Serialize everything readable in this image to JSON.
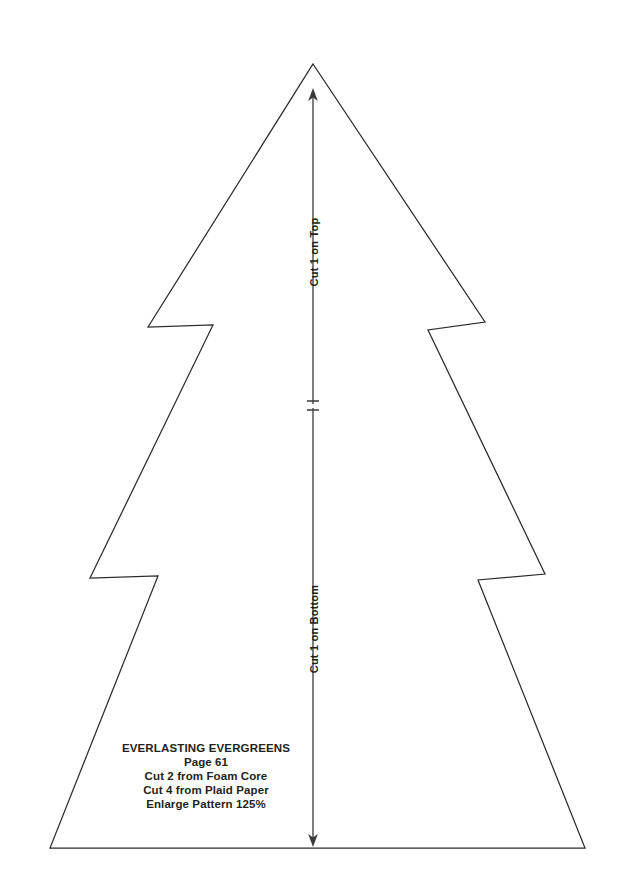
{
  "sheet": {
    "title": "Everlasting Evergreens tree pattern template",
    "background_color": "#ffffff",
    "outline_color": "#2b2b2b",
    "text_color": "#231f20",
    "width": 626,
    "height": 891
  },
  "annotations": {
    "top_segment_label": "Cut 1 on Top",
    "bottom_segment_label": "Cut 1 on Bottom"
  },
  "caption": {
    "title": "EVERLASTING EVERGREENS",
    "line_page": "Page 61",
    "line_foam": "Cut 2 from Foam Core",
    "line_plaid": "Cut 4 from Plaid Paper",
    "line_enlarge": "Enlarge Pattern 125%"
  },
  "shape_data": {
    "type": "path",
    "name": "christmas-tree-outline",
    "apex": [
      313,
      64
    ],
    "base_left": [
      50,
      848
    ],
    "base_right": [
      585,
      848
    ],
    "tier_notch_y": [
      325,
      577
    ],
    "points": "313,64 485,322 428,330 545,574 478,580 585,848 50,848 158,576 90,578 213,325 148,327"
  },
  "arrow": {
    "x": 313,
    "top_y": 90,
    "bottom_y": 845,
    "mid_tick_y": [
      400,
      410
    ],
    "head_style": "double-ended"
  }
}
